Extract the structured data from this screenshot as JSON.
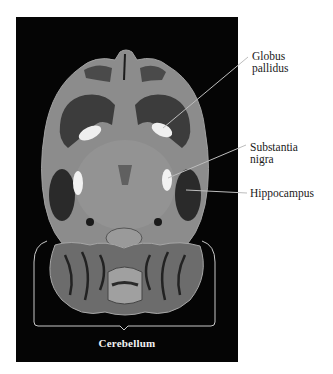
{
  "figure": {
    "type": "anatomical-mri-scan",
    "panel_background": "#050505",
    "tissue_color": "#8e8e8e",
    "dark_matter_color": "#2c2c2c",
    "bright_structure_color": "#f0f0f0",
    "leader_line_color": "#bdbdbd"
  },
  "labels": {
    "globus_pallidus": "Globus\npallidus",
    "substantia_nigra": "Substantia\nnigra",
    "hippocampus": "Hippocampus",
    "cerebellum": "Cerebellum"
  }
}
